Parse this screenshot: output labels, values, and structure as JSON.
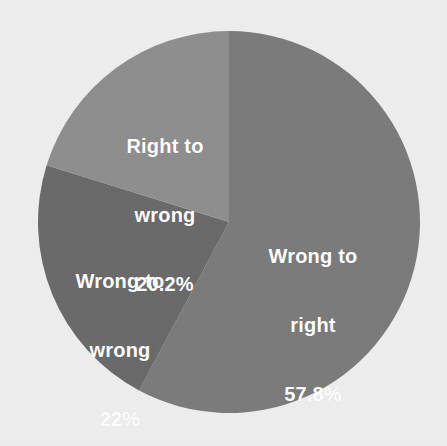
{
  "background_color": "#eeeeee",
  "label_color": "#ffffff",
  "chart_data": {
    "type": "pie",
    "title": "",
    "subtitle": "",
    "xlabel": "",
    "ylabel": "",
    "legend": "none",
    "grid": false,
    "start_angle_deg": 0,
    "direction": "clockwise",
    "center": {
      "x": 229,
      "y": 222
    },
    "radius": 191,
    "categories": [
      "Wrong to right",
      "Wrong to wrong",
      "Right to wrong"
    ],
    "values": [
      57.8,
      22,
      20.2
    ],
    "value_unit": "%",
    "value_labels": [
      "57.8%",
      "22%",
      "20.2%"
    ],
    "colors": [
      "#7b7b7b",
      "#6a6a6a",
      "#8e8e8e"
    ],
    "slices": [
      {
        "name": "Wrong to right",
        "label_line1": "Wrong to",
        "label_line2": "right",
        "value": 57.8,
        "value_label": "57.8%",
        "color": "#7b7b7b",
        "start_deg": 0,
        "end_deg": 208.08
      },
      {
        "name": "Wrong to wrong",
        "label_line1": "Wrong to",
        "label_line2": "wrong",
        "value": 22,
        "value_label": "22%",
        "color": "#6a6a6a",
        "start_deg": 208.08,
        "end_deg": 287.28
      },
      {
        "name": "Right to wrong",
        "label_line1": "Right to",
        "label_line2": "wrong",
        "value": 20.2,
        "value_label": "20.2%",
        "color": "#8e8e8e",
        "start_deg": 287.28,
        "end_deg": 360
      }
    ]
  }
}
